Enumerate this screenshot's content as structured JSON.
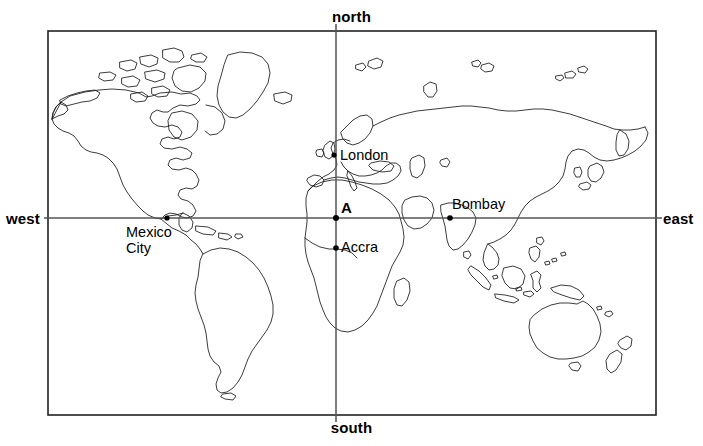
{
  "map": {
    "title": "World map with directional axes",
    "frame": {
      "x": 48,
      "y": 31,
      "width": 608,
      "height": 384
    },
    "background_color": "#ffffff",
    "outline_color": "#1a1a1a",
    "border_color": "#222222",
    "axis_color": "#555555"
  },
  "directions": {
    "north": "north",
    "south": "south",
    "west": "west",
    "east": "east"
  },
  "axes": {
    "vertical": {
      "x": 336,
      "y_top": 24,
      "y_bottom": 422,
      "label_top": "north",
      "label_bottom": "south"
    },
    "horizontal": {
      "y": 218,
      "x_left": 44,
      "x_right": 662,
      "label_left": "west",
      "label_right": "east"
    },
    "origin": {
      "x": 336,
      "y": 218,
      "label": "A"
    }
  },
  "points": [
    {
      "name": "A",
      "label": "A",
      "x": 336,
      "y": 218,
      "label_dx": 5,
      "label_dy": -19,
      "bold": true,
      "marker": true
    },
    {
      "name": "london",
      "label": "London",
      "x": 334,
      "y": 155,
      "label_dx": 6,
      "label_dy": -8,
      "bold": false,
      "marker": true
    },
    {
      "name": "bombay",
      "label": "Bombay",
      "x": 450,
      "y": 218,
      "label_dx": 2,
      "label_dy": -22,
      "bold": false,
      "marker": true
    },
    {
      "name": "accra",
      "label": "Accra",
      "x": 336,
      "y": 248,
      "label_dx": 5,
      "label_dy": -9,
      "bold": false,
      "marker": true
    },
    {
      "name": "mexico-city",
      "label": "Mexico City",
      "x": 167,
      "y": 218,
      "label_dx": -41,
      "label_dy": 6,
      "bold": false,
      "marker": true
    }
  ],
  "city_labels": {
    "london": "London",
    "bombay": "Bombay",
    "accra": "Accra",
    "mexico_city_line1": "Mexico",
    "mexico_city_line2": "City",
    "origin": "A"
  }
}
